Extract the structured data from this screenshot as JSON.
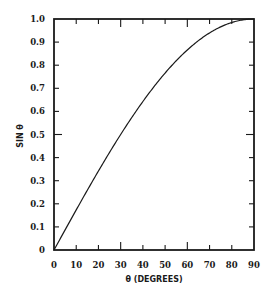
{
  "chart_data": {
    "type": "line",
    "title": "",
    "xlabel": "θ (DEGREES)",
    "ylabel": "SIN θ",
    "xlim": [
      0,
      90
    ],
    "ylim": [
      0,
      1.0
    ],
    "grid": false,
    "legend": null,
    "x_ticks": [
      "0",
      "10",
      "20",
      "30",
      "40",
      "50",
      "60",
      "70",
      "80",
      "90"
    ],
    "y_ticks": [
      "0",
      "0.1",
      "0.2",
      "0.3",
      "0.4",
      "0.5",
      "0.6",
      "0.7",
      "0.8",
      "0.9",
      "1.0"
    ],
    "series": [
      {
        "name": "sin θ",
        "x": [
          0,
          10,
          20,
          30,
          40,
          50,
          60,
          70,
          80,
          90
        ],
        "values": [
          0,
          0.174,
          0.342,
          0.5,
          0.643,
          0.766,
          0.866,
          0.94,
          0.985,
          1.0
        ]
      }
    ]
  }
}
